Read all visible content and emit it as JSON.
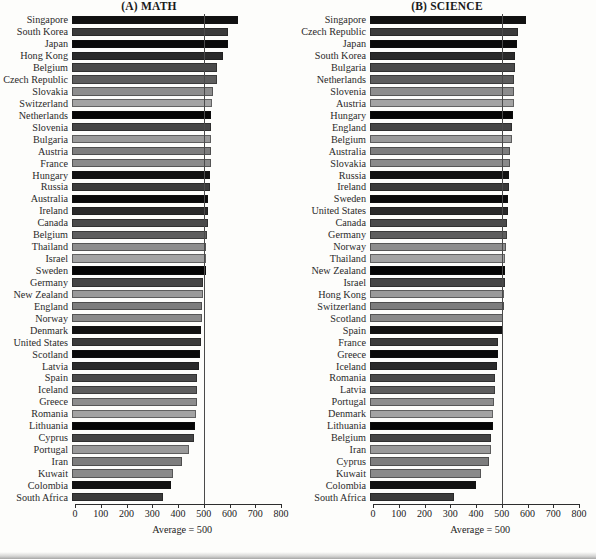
{
  "figure": {
    "background": "#fdfdfb",
    "axis_note": "Average = 500"
  },
  "panels": [
    {
      "id": "math",
      "title": "(A) MATH"
    },
    {
      "id": "science",
      "title": "(B) SCIENCE"
    }
  ],
  "axis": {
    "ticks": [
      0,
      100,
      200,
      300,
      400,
      500,
      600,
      700,
      800
    ],
    "tick_labels": [
      "0",
      "100",
      "200",
      "300",
      "400",
      "500",
      "600",
      "700",
      "800"
    ],
    "min": 0,
    "max": 800,
    "reference_value": 500,
    "reference_label": "Average = 500"
  },
  "chart_data": [
    {
      "type": "bar",
      "orientation": "horizontal",
      "title": "(A) MATH",
      "xlabel": "",
      "ylabel": "",
      "xlim": [
        0,
        800
      ],
      "grid": false,
      "legend": "none",
      "annotations": [
        "Average = 500"
      ],
      "reference_line": 500,
      "categories": [
        "Singapore",
        "South Korea",
        "Japan",
        "Hong Kong",
        "Belgium",
        "Czech Republic",
        "Slovakia",
        "Switzerland",
        "Netherlands",
        "Slovenia",
        "Bulgaria",
        "Austria",
        "France",
        "Hungary",
        "Russia",
        "Australia",
        "Ireland",
        "Canada",
        "Belgium",
        "Thailand",
        "Israel",
        "Sweden",
        "Germany",
        "New Zealand",
        "England",
        "Norway",
        "Denmark",
        "United States",
        "Scotland",
        "Latvia",
        "Spain",
        "Iceland",
        "Greece",
        "Romania",
        "Lithuania",
        "Cyprus",
        "Portugal",
        "Iran",
        "Kuwait",
        "Colombia",
        "South Africa"
      ],
      "values": [
        643,
        607,
        605,
        588,
        565,
        564,
        547,
        545,
        541,
        541,
        540,
        539,
        538,
        537,
        535,
        530,
        527,
        527,
        526,
        522,
        522,
        519,
        509,
        508,
        506,
        503,
        502,
        500,
        498,
        493,
        487,
        487,
        484,
        482,
        477,
        474,
        454,
        428,
        392,
        385,
        354
      ]
    },
    {
      "type": "bar",
      "orientation": "horizontal",
      "title": "(B) SCIENCE",
      "xlabel": "",
      "ylabel": "",
      "xlim": [
        0,
        800
      ],
      "grid": false,
      "legend": "none",
      "annotations": [
        "Average = 500"
      ],
      "reference_line": 500,
      "categories": [
        "Singapore",
        "Czech Republic",
        "Japan",
        "South Korea",
        "Bulgaria",
        "Netherlands",
        "Slovenia",
        "Austria",
        "Hungary",
        "England",
        "Belgium",
        "Australia",
        "Slovakia",
        "Russia",
        "Ireland",
        "Sweden",
        "United States",
        "Canada",
        "Germany",
        "Norway",
        "Thailand",
        "New Zealand",
        "Israel",
        "Hong Kong",
        "Switzerland",
        "Scotland",
        "Spain",
        "France",
        "Greece",
        "Iceland",
        "Romania",
        "Latvia",
        "Portugal",
        "Denmark",
        "Lithuania",
        "Belgium",
        "Iran",
        "Cyprus",
        "Kuwait",
        "Colombia",
        "South Africa"
      ],
      "values": [
        607,
        574,
        571,
        565,
        565,
        560,
        560,
        558,
        554,
        552,
        550,
        545,
        544,
        538,
        538,
        535,
        534,
        531,
        531,
        527,
        525,
        525,
        524,
        522,
        522,
        517,
        517,
        498,
        497,
        494,
        486,
        485,
        480,
        478,
        476,
        471,
        470,
        463,
        430,
        411,
        326
      ]
    }
  ]
}
